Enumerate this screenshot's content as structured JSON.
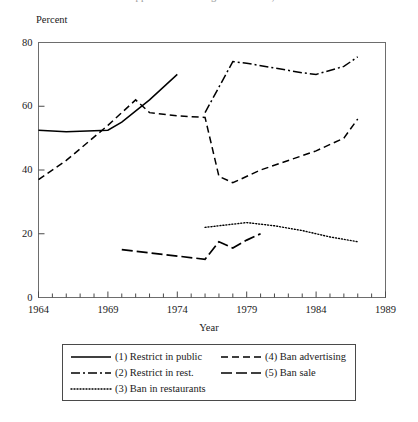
{
  "title_sliver": "Public Support for Smoking Restrictions, 1964-1989",
  "axis": {
    "ylabel": "Percent",
    "xlabel": "Year",
    "ytick_labels": [
      "0",
      "20",
      "40",
      "60",
      "80"
    ],
    "xtick_labels": [
      "1964",
      "1969",
      "1974",
      "1979",
      "1984",
      "1989"
    ]
  },
  "legend": {
    "entries": [
      {
        "label": "(1) Restrict in public",
        "style": "solid"
      },
      {
        "label": "(2) Restrict in rest.",
        "style": "dash-dot"
      },
      {
        "label": "(3) Ban in restaurants",
        "style": "dotted"
      },
      {
        "label": "(4) Ban advertising",
        "style": "dashed"
      },
      {
        "label": "(5) Ban sale",
        "style": "dash-long"
      }
    ]
  },
  "chart_data": {
    "type": "line",
    "title": "Public Support for Smoking Restrictions, 1964-1989",
    "xlabel": "Year",
    "ylabel": "Percent",
    "xlim": [
      1964,
      1989
    ],
    "ylim": [
      0,
      80
    ],
    "yticks": [
      0,
      20,
      40,
      60,
      80
    ],
    "xticks": [
      1964,
      1969,
      1974,
      1979,
      1984,
      1989
    ],
    "xminor_tick_interval": 1,
    "grid": false,
    "legend_position": "below-axes",
    "series": [
      {
        "name": "(1) Restrict in public",
        "style": "solid",
        "color": "#000000",
        "x": [
          1964,
          1966,
          1969,
          1970,
          1972,
          1974
        ],
        "y": [
          52.5,
          52.0,
          52.5,
          55.0,
          62.0,
          70.0
        ]
      },
      {
        "name": "(2) Restrict in rest.",
        "style": "dash-dot",
        "color": "#000000",
        "x": [
          1976,
          1977,
          1978,
          1979,
          1981,
          1983,
          1984,
          1986,
          1987
        ],
        "y": [
          58.0,
          66.0,
          74.0,
          73.5,
          72.0,
          70.5,
          70.0,
          72.5,
          75.5
        ]
      },
      {
        "name": "(3) Ban in restaurants",
        "style": "dotted",
        "color": "#000000",
        "x": [
          1976,
          1977,
          1979,
          1981,
          1983,
          1985,
          1987
        ],
        "y": [
          22.0,
          22.5,
          23.5,
          22.5,
          21.0,
          19.0,
          17.5
        ]
      },
      {
        "name": "(4) Ban advertising",
        "style": "dashed",
        "color": "#000000",
        "x": [
          1964,
          1966,
          1969,
          1971,
          1972,
          1974,
          1976,
          1977,
          1978,
          1980,
          1982,
          1984,
          1986,
          1987
        ],
        "y": [
          37.0,
          43.0,
          54.0,
          62.0,
          58.0,
          57.0,
          56.5,
          38.0,
          36.0,
          40.0,
          43.0,
          46.0,
          50.0,
          56.0
        ]
      },
      {
        "name": "(5) Ban sale",
        "style": "dash-long",
        "color": "#000000",
        "x": [
          1970,
          1972,
          1974,
          1976,
          1977,
          1978,
          1979,
          1980
        ],
        "y": [
          15.0,
          14.0,
          13.0,
          12.0,
          17.5,
          15.5,
          18.0,
          20.0
        ]
      }
    ]
  }
}
